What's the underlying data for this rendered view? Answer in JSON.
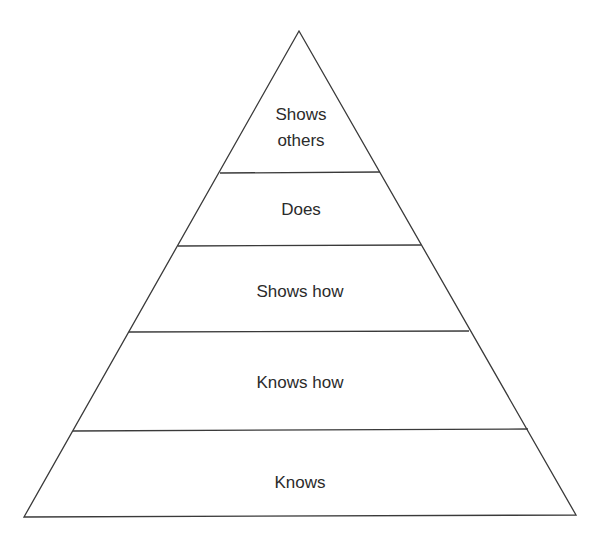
{
  "diagram": {
    "type": "pyramid",
    "title": "",
    "tiers_top_to_bottom": [
      {
        "label_line1": "Shows",
        "label_line2": "others"
      },
      {
        "label_line1": "Does"
      },
      {
        "label_line1": "Shows how"
      },
      {
        "label_line1": "Knows how"
      },
      {
        "label_line1": "Knows"
      }
    ],
    "colors": {
      "stroke": "#3a3a3a",
      "fill": "#ffffff",
      "text": "#2b2b2b",
      "background": "#ffffff"
    }
  }
}
